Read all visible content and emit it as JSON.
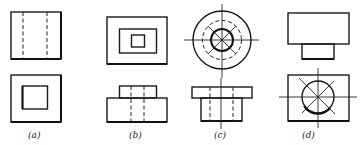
{
  "figure": {
    "stroke_color": "#1a1a1a",
    "background_color": "#ffffff",
    "panels": [
      {
        "id": "a",
        "label": "(a)",
        "top_view": "square with two vertical hidden (dashed) lines",
        "bottom_view": "square with concentric smaller square"
      },
      {
        "id": "b",
        "label": "(b)",
        "top_view": "three nested rectangles",
        "bottom_view": "stepped block with two vertical hidden lines"
      },
      {
        "id": "c",
        "label": "(c)",
        "top_view": "concentric circles (solid outer, dashed middle, solid inner) with centerlines and diagonals",
        "bottom_view": "flanged cylinder elevation with hidden lines and vertical centerline"
      },
      {
        "id": "d",
        "label": "(d)",
        "top_view": "wide rectangle atop narrower rectangle",
        "bottom_view": "rectangle with circle, centerlines and diagonals"
      }
    ]
  }
}
